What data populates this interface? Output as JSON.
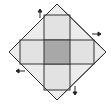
{
  "diagram": {
    "colors": {
      "background": "#ffffff",
      "diamond_fill": "#ececec",
      "arm_fill": "#e2e2e2",
      "center_fill": "#a8a8a8",
      "stroke": "#333333"
    },
    "arrows": [
      {
        "direction": "up",
        "label": ""
      },
      {
        "direction": "right",
        "label": ""
      },
      {
        "direction": "down",
        "label": ""
      },
      {
        "direction": "left",
        "label": ""
      }
    ]
  }
}
